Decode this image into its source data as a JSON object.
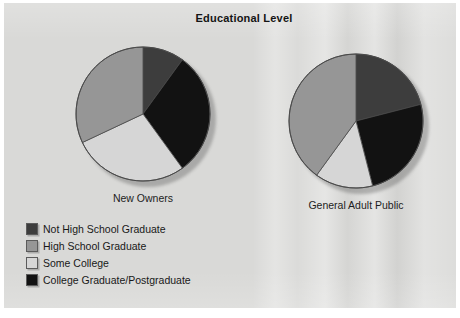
{
  "figure": {
    "title": "Educational Level",
    "background_color": "#d9d9d7",
    "page_color": "#ffffff"
  },
  "legend": {
    "items": [
      {
        "label": "Not High School Graduate",
        "color": "#3d3d3d",
        "key": "not_hs_grad"
      },
      {
        "label": "High School Graduate",
        "color": "#969696",
        "key": "hs_grad"
      },
      {
        "label": "Some College",
        "color": "#d6d6d6",
        "key": "some_college"
      },
      {
        "label": "College Graduate/Postgraduate",
        "color": "#121212",
        "key": "college_grad"
      }
    ]
  },
  "chart_data": {
    "type": "pie",
    "title": "Educational Level",
    "legend_position": "bottom-left",
    "categories": [
      "Not High School Graduate",
      "High School Graduate",
      "Some College",
      "College Graduate/Postgraduate"
    ],
    "colors": [
      "#3d3d3d",
      "#969696",
      "#d6d6d6",
      "#121212"
    ],
    "charts": [
      {
        "name": "New Owners",
        "label": "New Owners",
        "slice_order": [
          "Not High School Graduate",
          "College Graduate/Postgraduate",
          "Some College",
          "High School Graduate"
        ],
        "values_percent": [
          10,
          30,
          28,
          32
        ],
        "start_angle_deg": 0,
        "direction": "clockwise"
      },
      {
        "name": "General Adult Public",
        "label": "General Adult Public",
        "slice_order": [
          "Not High School Graduate",
          "College Graduate/Postgraduate",
          "Some College",
          "High School Graduate"
        ],
        "values_percent": [
          21,
          25,
          14,
          40
        ],
        "start_angle_deg": 0,
        "direction": "clockwise"
      }
    ]
  }
}
